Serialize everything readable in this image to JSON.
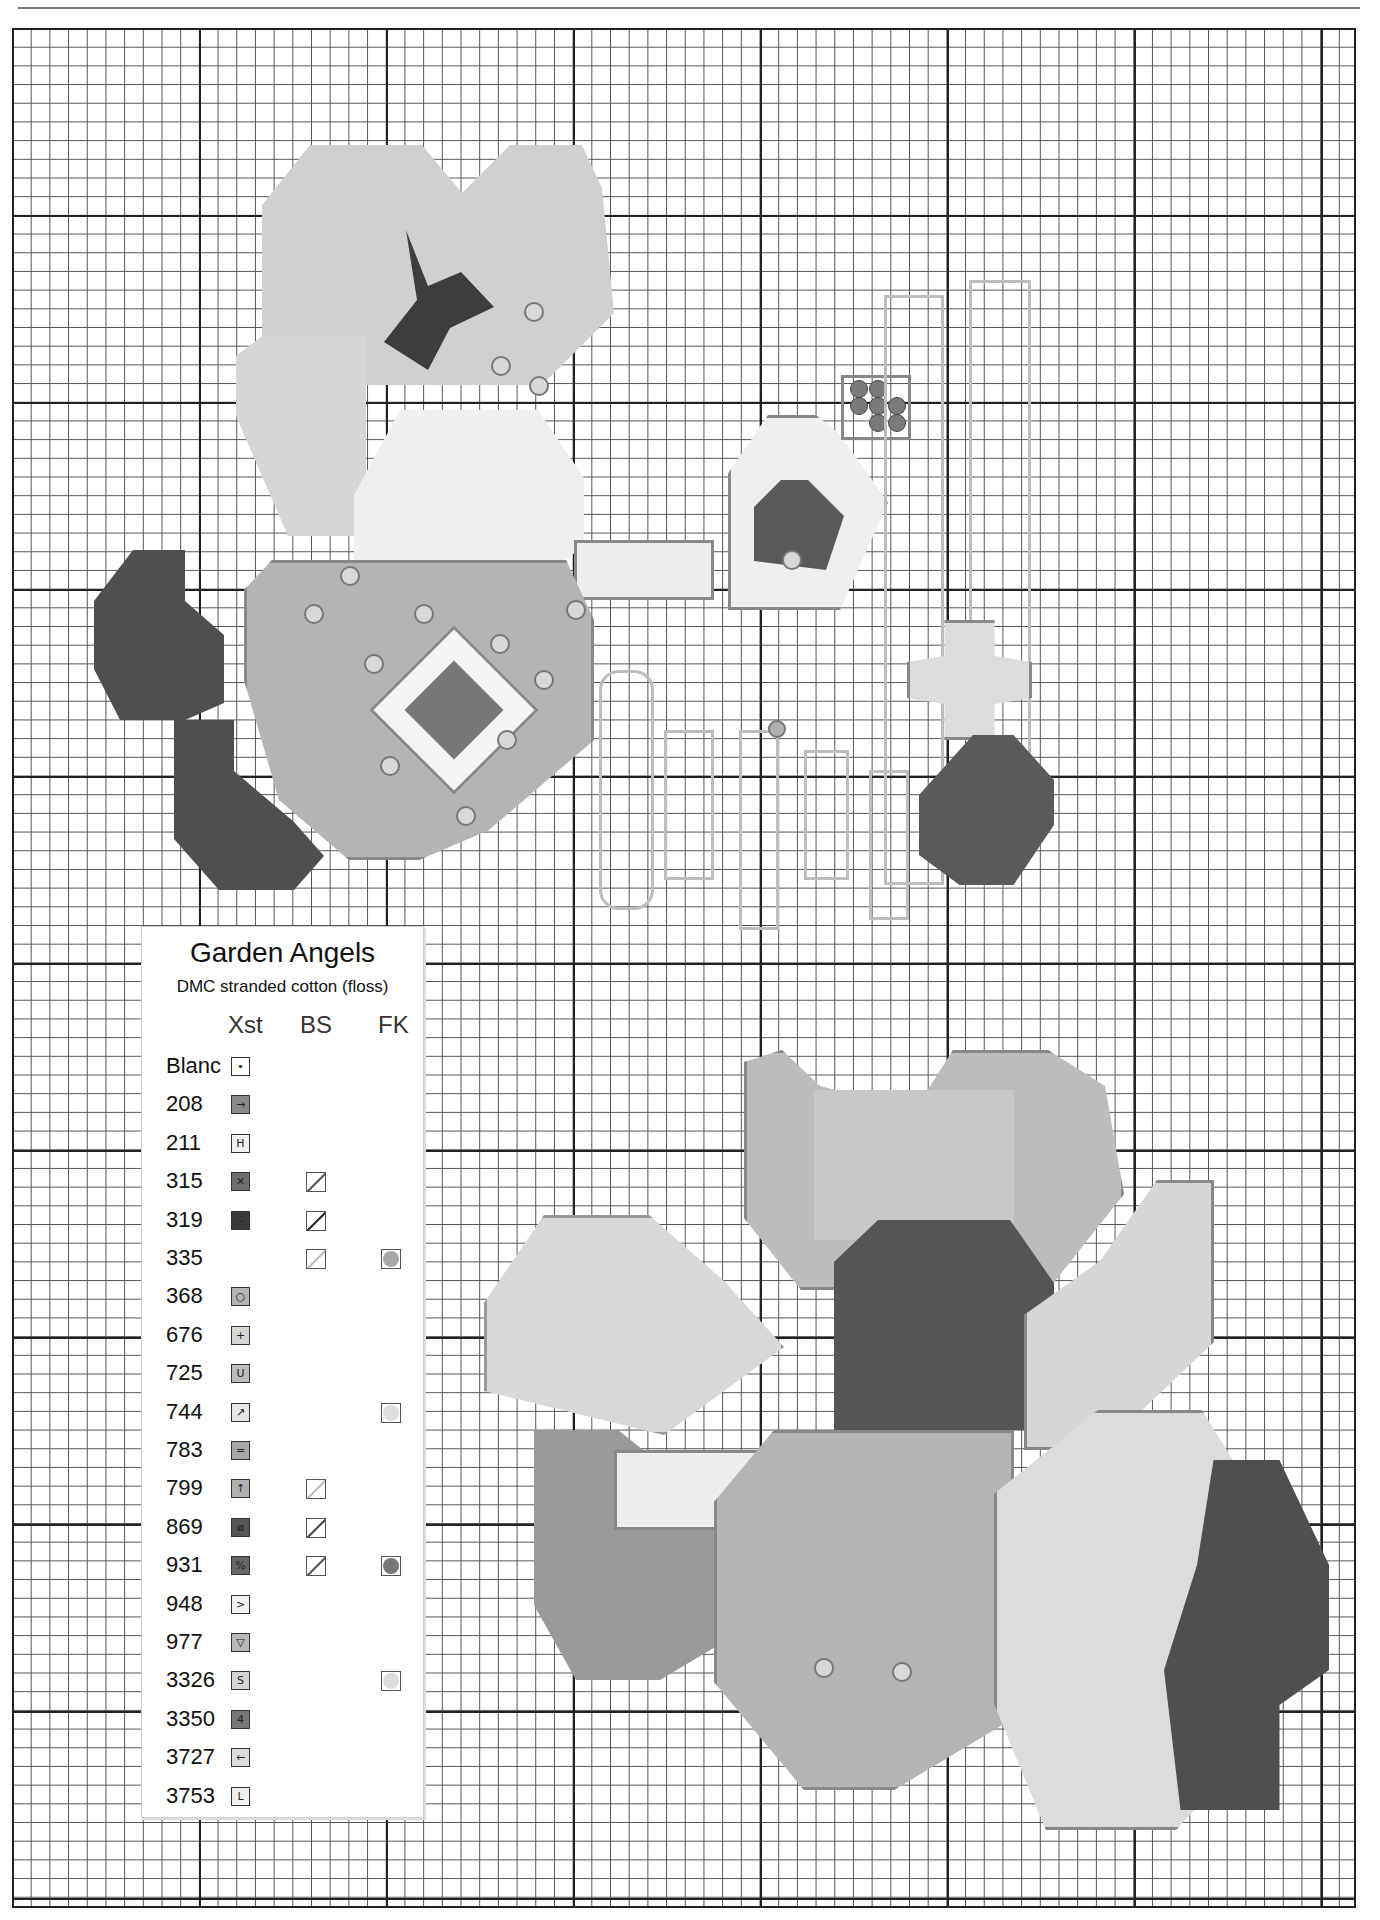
{
  "page": {
    "header_rule": true
  },
  "legend": {
    "title": "Garden Angels",
    "subtitle": "DMC stranded cotton (floss)",
    "columns": {
      "xst": "Xst",
      "bs": "BS",
      "fk": "FK"
    },
    "rows": [
      {
        "code": "Blanc",
        "symbol": "•",
        "fill": "#ffffff",
        "bs": null,
        "fk": null
      },
      {
        "code": "208",
        "symbol": "→",
        "fill": "#8a8a8a",
        "bs": null,
        "fk": null
      },
      {
        "code": "211",
        "symbol": "H",
        "fill": "#f2f2f2",
        "bs": null,
        "fk": null
      },
      {
        "code": "315",
        "symbol": "✕",
        "fill": "#6e6e6e",
        "bs": "#555555",
        "fk": null
      },
      {
        "code": "319",
        "symbol": "–",
        "fill": "#3a3a3a",
        "bs": "#222222",
        "fk": null
      },
      {
        "code": "335",
        "symbol": "",
        "fill": null,
        "bs": "#bbbbbb",
        "fk": "#a8a8a8"
      },
      {
        "code": "368",
        "symbol": "○",
        "fill": "#b4b4b4",
        "bs": null,
        "fk": null
      },
      {
        "code": "676",
        "symbol": "+",
        "fill": "#d6d6d6",
        "bs": null,
        "fk": null
      },
      {
        "code": "725",
        "symbol": "U",
        "fill": "#bcbcbc",
        "bs": null,
        "fk": null
      },
      {
        "code": "744",
        "symbol": "↗",
        "fill": "#e6e6e6",
        "bs": null,
        "fk": "#dedede"
      },
      {
        "code": "783",
        "symbol": "=",
        "fill": "#a6a6a6",
        "bs": null,
        "fk": null
      },
      {
        "code": "799",
        "symbol": "↑",
        "fill": "#b0b0b0",
        "bs": "#bbbbbb",
        "fk": null
      },
      {
        "code": "869",
        "symbol": "ø",
        "fill": "#555555",
        "bs": "#444444",
        "fk": null
      },
      {
        "code": "931",
        "symbol": "%",
        "fill": "#666666",
        "bs": "#555555",
        "fk": "#777777"
      },
      {
        "code": "948",
        "symbol": ">",
        "fill": "#f0f0f0",
        "bs": null,
        "fk": null
      },
      {
        "code": "977",
        "symbol": "▽",
        "fill": "#b8b8b8",
        "bs": null,
        "fk": null
      },
      {
        "code": "3326",
        "symbol": "S",
        "fill": "#d4d4d4",
        "bs": null,
        "fk": "#dcdcdc"
      },
      {
        "code": "3350",
        "symbol": "4",
        "fill": "#777777",
        "bs": null,
        "fk": null
      },
      {
        "code": "3727",
        "symbol": "←",
        "fill": "#dcdcdc",
        "bs": null,
        "fk": null
      },
      {
        "code": "3753",
        "symbol": "L",
        "fill": "#efefef",
        "bs": null,
        "fk": null
      }
    ]
  }
}
